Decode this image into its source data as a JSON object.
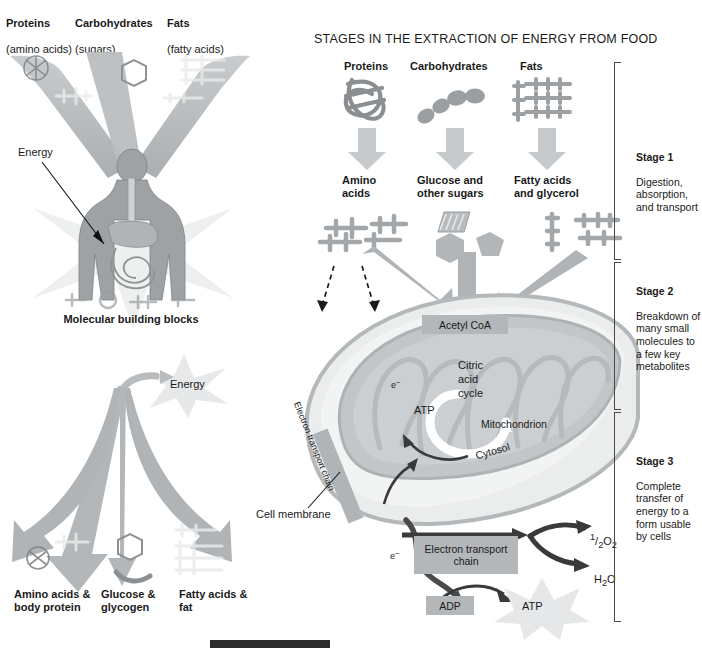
{
  "figure": {
    "title": "STAGES IN THE EXTRACTION OF ENERGY FROM FOOD"
  },
  "left_panel": {
    "top_labels": [
      {
        "name": "Proteins",
        "sub": "(amino acids)"
      },
      {
        "name": "Carbohydrates",
        "sub": "(sugars)"
      },
      {
        "name": "Fats",
        "sub": "(fatty acids)"
      }
    ],
    "energy_label_top": "Energy",
    "middle_caption": "Molecular building blocks",
    "energy_label_bottom": "Energy",
    "bottom_labels": [
      "Amino acids &\nbody protein",
      "Glucose &\nglycogen",
      "Fatty acids &\nfat"
    ]
  },
  "main_panel": {
    "food_labels": [
      "Proteins",
      "Carbohydrates",
      "Fats"
    ],
    "product_labels": [
      "Amino\nacids",
      "Glucose and\nother sugars",
      "Fatty acids\nand glycerol"
    ],
    "acetyl_coa": "Acetyl CoA",
    "citric_acid_cycle": "Citric\nacid\ncycle",
    "atp_mito": "ATP",
    "mitochondrion": "Mitochondrion",
    "electron_transport_chain_mito": "Electron transport chain",
    "cell_membrane": "Cell membrane",
    "cytosol": "Cytosol",
    "electron_in_mito": "e",
    "electron_in_mito_sup": "–",
    "electron_lower": "e",
    "electron_lower_sup": "–",
    "etc_box": "Electron transport\nchain",
    "half_o2_num": "1",
    "half_o2_den": "2",
    "half_o2_species": "O",
    "half_o2_sub": "2",
    "water_h": "H",
    "water_sub": "2",
    "water_o": "O",
    "adp": "ADP",
    "atp_bottom": "ATP"
  },
  "stages": [
    {
      "title": "Stage 1",
      "body": "Digestion,\nabsorption,\nand transport"
    },
    {
      "title": "Stage 2",
      "body": "Breakdown of\nmany small\nmolecules to\na few key\nmetabolites"
    },
    {
      "title": "Stage 3",
      "body": "Complete\ntransfer of\nenergy to a\nform usable\nby cells"
    }
  ],
  "colors": {
    "arrow_light": "#c9ccce",
    "arrow_mid": "#a8acae",
    "chip_gray": "#b3b7ba",
    "cell_fill": "#e6e7e8",
    "mito_fill": "#bfc3c5",
    "dark_arrow": "#4a4a4a",
    "text": "#1a1a1a"
  }
}
